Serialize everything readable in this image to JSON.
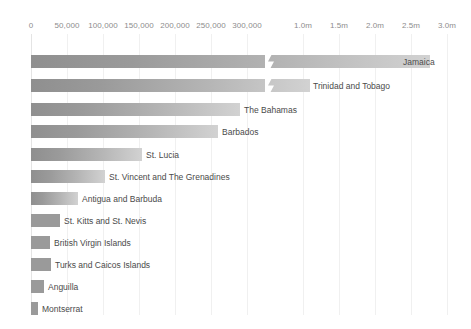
{
  "chart_data": {
    "type": "bar",
    "orientation": "horizontal",
    "title": "",
    "subtitle": "",
    "xlabel": "",
    "ylabel": "",
    "grid": true,
    "legend": null,
    "broken_axis": true,
    "axis_note": "Broken x-axis: lower segment 0 to 300,000 (linear), upper segment 1.0m to 3.0m (linear)",
    "axis_segments": [
      {
        "name": "lower",
        "min": 0,
        "max": 300000,
        "tick_values": [
          0,
          50000,
          100000,
          150000,
          200000,
          250000,
          300000
        ],
        "tick_labels": [
          "0",
          "50,000",
          "100,000",
          "150,000",
          "200,000",
          "250,000",
          "300,000"
        ]
      },
      {
        "name": "upper",
        "min": 1000000,
        "max": 3000000,
        "tick_values": [
          1000000,
          1500000,
          2000000,
          2500000,
          3000000
        ],
        "tick_labels": [
          "1.0m",
          "1.5m",
          "2.0m",
          "2.5m",
          "3.0m"
        ]
      }
    ],
    "categories": [
      "Jamaica",
      "Trinidad and Tobago",
      "The Bahamas",
      "Barbados",
      "St. Lucia",
      "St. Vincent and The Grenadines",
      "Antigua and Barbuda",
      "St. Kitts and St. Nevis",
      "British Virgin Islands",
      "Turks and Caicos Islands",
      "Anguilla",
      "Montserrat"
    ],
    "values": [
      2790000,
      1140000,
      290000,
      260000,
      154000,
      103000,
      65000,
      40000,
      26000,
      27000,
      18000,
      10000
    ],
    "value_labels": [
      "2.79m",
      "1.14m",
      "290,000",
      "260,000",
      "154,000",
      "103,000",
      "65,000",
      "40,000",
      "26,000",
      "27,000",
      "18,000",
      "10,000"
    ]
  },
  "axis": {
    "ticks": [
      {
        "label": "0",
        "x": 31
      },
      {
        "label": "50,000",
        "x": 67
      },
      {
        "label": "100,000",
        "x": 103
      },
      {
        "label": "150,000",
        "x": 139
      },
      {
        "label": "200,000",
        "x": 175
      },
      {
        "label": "250,000",
        "x": 211
      },
      {
        "label": "300,000",
        "x": 247
      },
      {
        "label": "1.0m",
        "x": 303
      },
      {
        "label": "1.5m",
        "x": 339
      },
      {
        "label": "2.0m",
        "x": 375
      },
      {
        "label": "2.5m",
        "x": 411
      },
      {
        "label": "3.0m",
        "x": 447
      }
    ]
  },
  "bars": [
    {
      "name": "Jamaica",
      "y": 55,
      "width": 399,
      "label_x": 403,
      "label_inside": true,
      "has_break": true,
      "break_x": 265
    },
    {
      "name": "Trinidad and Tobago",
      "y": 79,
      "width": 279,
      "label_x": 313,
      "label_inside": false,
      "has_break": true,
      "break_x": 265
    },
    {
      "name": "The Bahamas",
      "y": 103,
      "width": 209,
      "label_x": 244,
      "label_inside": false,
      "has_break": false,
      "break_x": 0
    },
    {
      "name": "Barbados",
      "y": 125,
      "width": 187,
      "label_x": 222,
      "label_inside": false,
      "has_break": false,
      "break_x": 0
    },
    {
      "name": "St. Lucia",
      "y": 148,
      "width": 111,
      "label_x": 146,
      "label_inside": false,
      "has_break": false,
      "break_x": 0
    },
    {
      "name": "St. Vincent and The Grenadines",
      "y": 170,
      "width": 74,
      "label_x": 109,
      "label_inside": false,
      "has_break": false,
      "break_x": 0
    },
    {
      "name": "Antigua and Barbuda",
      "y": 192,
      "width": 47,
      "label_x": 82,
      "label_inside": false,
      "has_break": false,
      "break_x": 0
    },
    {
      "name": "St. Kitts and St. Nevis",
      "y": 214,
      "width": 29,
      "label_x": 64,
      "label_inside": false,
      "has_break": false,
      "break_x": 0
    },
    {
      "name": "British Virgin Islands",
      "y": 236,
      "width": 19,
      "label_x": 54,
      "label_inside": false,
      "has_break": false,
      "break_x": 0
    },
    {
      "name": "Turks and Caicos Islands",
      "y": 258,
      "width": 20,
      "label_x": 55,
      "label_inside": false,
      "has_break": false,
      "break_x": 0
    },
    {
      "name": "Anguilla",
      "y": 280,
      "width": 13,
      "label_x": 48,
      "label_inside": false,
      "has_break": false,
      "break_x": 0
    },
    {
      "name": "Montserrat",
      "y": 302,
      "width": 7,
      "label_x": 42,
      "label_inside": false,
      "has_break": false,
      "break_x": 0
    }
  ],
  "colors": {
    "bar_gradient_start": "#8f8f8f",
    "bar_gradient_end": "#d2d2d2",
    "gridline": "#f0f0f0",
    "axis_line": "#e4e4e4",
    "tick_text": "#8d8d8d",
    "label_text": "#4a4a4a",
    "background": "#ffffff"
  }
}
